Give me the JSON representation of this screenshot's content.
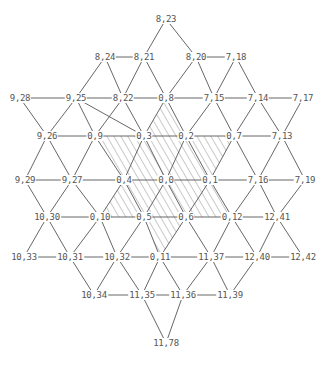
{
  "diagram": {
    "type": "triangular-lattice-graph",
    "colors": {
      "line": "#555555",
      "text": "#555555",
      "hatch": "#777777",
      "background": "#ffffff"
    },
    "nodes": [
      {
        "id": "8,23",
        "x": 166,
        "y": 19
      },
      {
        "id": "8,24",
        "x": 105,
        "y": 57
      },
      {
        "id": "8,21",
        "x": 144,
        "y": 57
      },
      {
        "id": "8,20",
        "x": 196,
        "y": 57
      },
      {
        "id": "7,18",
        "x": 236,
        "y": 57
      },
      {
        "id": "9,28",
        "x": 20,
        "y": 98
      },
      {
        "id": "9,25",
        "x": 76,
        "y": 98
      },
      {
        "id": "8,22",
        "x": 123,
        "y": 98
      },
      {
        "id": "0,8",
        "x": 166,
        "y": 98
      },
      {
        "id": "7,15",
        "x": 214,
        "y": 98
      },
      {
        "id": "7,14",
        "x": 258,
        "y": 98
      },
      {
        "id": "7,17",
        "x": 303,
        "y": 98
      },
      {
        "id": "9,26",
        "x": 47,
        "y": 136
      },
      {
        "id": "0,9",
        "x": 95,
        "y": 136
      },
      {
        "id": "0,3",
        "x": 144,
        "y": 136
      },
      {
        "id": "0,2",
        "x": 186,
        "y": 136
      },
      {
        "id": "0,7",
        "x": 234,
        "y": 136
      },
      {
        "id": "7,13",
        "x": 282,
        "y": 136
      },
      {
        "id": "9,29",
        "x": 25,
        "y": 180
      },
      {
        "id": "9,27",
        "x": 72,
        "y": 180
      },
      {
        "id": "0,4",
        "x": 124,
        "y": 180
      },
      {
        "id": "0,0",
        "x": 166,
        "y": 180
      },
      {
        "id": "0,1",
        "x": 210,
        "y": 180
      },
      {
        "id": "7,16",
        "x": 258,
        "y": 180
      },
      {
        "id": "7,19",
        "x": 305,
        "y": 180
      },
      {
        "id": "10,30",
        "x": 47,
        "y": 217
      },
      {
        "id": "0,10",
        "x": 100,
        "y": 217
      },
      {
        "id": "0,5",
        "x": 144,
        "y": 217
      },
      {
        "id": "0,6",
        "x": 186,
        "y": 217
      },
      {
        "id": "0,12",
        "x": 232,
        "y": 217
      },
      {
        "id": "12,41",
        "x": 277,
        "y": 217
      },
      {
        "id": "10,33",
        "x": 24,
        "y": 257
      },
      {
        "id": "10,31",
        "x": 70,
        "y": 257
      },
      {
        "id": "10,32",
        "x": 117,
        "y": 257
      },
      {
        "id": "0,11",
        "x": 160,
        "y": 257
      },
      {
        "id": "11,37",
        "x": 211,
        "y": 257
      },
      {
        "id": "12,40",
        "x": 257,
        "y": 257
      },
      {
        "id": "12,42",
        "x": 303,
        "y": 257
      },
      {
        "id": "10,34",
        "x": 94,
        "y": 295
      },
      {
        "id": "11,35",
        "x": 142,
        "y": 295
      },
      {
        "id": "11,36",
        "x": 183,
        "y": 295
      },
      {
        "id": "11,39",
        "x": 230,
        "y": 295
      },
      {
        "id": "11,78",
        "x": 166,
        "y": 343
      }
    ],
    "edges": [
      [
        "8,23",
        "8,21"
      ],
      [
        "8,23",
        "8,20"
      ],
      [
        "8,24",
        "8,21"
      ],
      [
        "8,20",
        "7,18"
      ],
      [
        "8,24",
        "9,25"
      ],
      [
        "8,24",
        "8,22"
      ],
      [
        "8,21",
        "8,22"
      ],
      [
        "8,21",
        "0,8"
      ],
      [
        "8,20",
        "0,8"
      ],
      [
        "8,20",
        "7,15"
      ],
      [
        "7,18",
        "7,15"
      ],
      [
        "7,18",
        "7,14"
      ],
      [
        "9,28",
        "9,25"
      ],
      [
        "9,25",
        "8,22"
      ],
      [
        "8,22",
        "0,8"
      ],
      [
        "0,8",
        "7,15"
      ],
      [
        "7,15",
        "7,14"
      ],
      [
        "7,14",
        "7,17"
      ],
      [
        "9,28",
        "9,26"
      ],
      [
        "9,25",
        "9,26"
      ],
      [
        "9,25",
        "0,9"
      ],
      [
        "9,25",
        "0,3"
      ],
      [
        "8,22",
        "0,9"
      ],
      [
        "8,22",
        "0,3"
      ],
      [
        "0,8",
        "0,3"
      ],
      [
        "0,8",
        "0,2"
      ],
      [
        "7,15",
        "0,2"
      ],
      [
        "7,15",
        "0,7"
      ],
      [
        "7,14",
        "0,7"
      ],
      [
        "7,14",
        "7,13"
      ],
      [
        "7,17",
        "7,13"
      ],
      [
        "9,26",
        "0,9"
      ],
      [
        "0,9",
        "0,3"
      ],
      [
        "0,3",
        "0,2"
      ],
      [
        "0,2",
        "0,7"
      ],
      [
        "0,7",
        "7,13"
      ],
      [
        "9,26",
        "9,29"
      ],
      [
        "9,26",
        "9,27"
      ],
      [
        "0,9",
        "9,27"
      ],
      [
        "0,9",
        "0,4"
      ],
      [
        "0,3",
        "0,4"
      ],
      [
        "0,3",
        "0,0"
      ],
      [
        "0,2",
        "0,0"
      ],
      [
        "0,2",
        "0,1"
      ],
      [
        "0,7",
        "0,1"
      ],
      [
        "0,7",
        "7,16"
      ],
      [
        "7,13",
        "7,16"
      ],
      [
        "7,13",
        "7,19"
      ],
      [
        "9,29",
        "9,27"
      ],
      [
        "9,27",
        "0,4"
      ],
      [
        "0,4",
        "0,0"
      ],
      [
        "0,0",
        "0,1"
      ],
      [
        "0,1",
        "7,16"
      ],
      [
        "7,16",
        "7,19"
      ],
      [
        "9,29",
        "10,30"
      ],
      [
        "9,27",
        "10,30"
      ],
      [
        "9,27",
        "0,10"
      ],
      [
        "0,4",
        "0,10"
      ],
      [
        "0,4",
        "0,5"
      ],
      [
        "0,0",
        "0,5"
      ],
      [
        "0,0",
        "0,6"
      ],
      [
        "0,1",
        "0,6"
      ],
      [
        "0,1",
        "0,12"
      ],
      [
        "7,16",
        "0,12"
      ],
      [
        "7,16",
        "12,41"
      ],
      [
        "7,19",
        "12,41"
      ],
      [
        "10,30",
        "0,10"
      ],
      [
        "0,10",
        "0,5"
      ],
      [
        "0,5",
        "0,6"
      ],
      [
        "0,6",
        "0,12"
      ],
      [
        "0,12",
        "12,41"
      ],
      [
        "10,30",
        "10,33"
      ],
      [
        "10,30",
        "10,31"
      ],
      [
        "0,10",
        "10,31"
      ],
      [
        "0,10",
        "10,32"
      ],
      [
        "0,5",
        "10,32"
      ],
      [
        "0,5",
        "0,11"
      ],
      [
        "0,6",
        "0,11"
      ],
      [
        "0,6",
        "11,37"
      ],
      [
        "0,12",
        "11,37"
      ],
      [
        "0,12",
        "12,40"
      ],
      [
        "12,41",
        "12,40"
      ],
      [
        "12,41",
        "12,42"
      ],
      [
        "10,33",
        "10,31"
      ],
      [
        "10,31",
        "10,32"
      ],
      [
        "10,32",
        "0,11"
      ],
      [
        "0,11",
        "11,37"
      ],
      [
        "11,37",
        "12,40"
      ],
      [
        "12,40",
        "12,42"
      ],
      [
        "10,31",
        "10,34"
      ],
      [
        "10,32",
        "10,34"
      ],
      [
        "10,32",
        "11,35"
      ],
      [
        "0,11",
        "11,35"
      ],
      [
        "0,11",
        "11,36"
      ],
      [
        "11,37",
        "11,36"
      ],
      [
        "11,37",
        "11,39"
      ],
      [
        "12,40",
        "11,39"
      ],
      [
        "10,34",
        "11,35"
      ],
      [
        "11,35",
        "11,36"
      ],
      [
        "11,36",
        "11,39"
      ],
      [
        "11,35",
        "11,78"
      ],
      [
        "11,36",
        "11,78"
      ]
    ],
    "hatched_triangles": [
      [
        "0,8",
        "0,3",
        "0,2"
      ],
      [
        "0,9",
        "0,3",
        "0,4"
      ],
      [
        "0,3",
        "0,4",
        "0,0"
      ],
      [
        "0,3",
        "0,2",
        "0,0"
      ],
      [
        "0,2",
        "0,0",
        "0,1"
      ],
      [
        "0,2",
        "0,7",
        "0,1"
      ],
      [
        "0,4",
        "0,10",
        "0,5"
      ],
      [
        "0,4",
        "0,0",
        "0,5"
      ],
      [
        "0,0",
        "0,5",
        "0,6"
      ],
      [
        "0,0",
        "0,1",
        "0,6"
      ],
      [
        "0,1",
        "0,6",
        "0,12"
      ],
      [
        "0,5",
        "0,6",
        "0,11"
      ]
    ]
  }
}
